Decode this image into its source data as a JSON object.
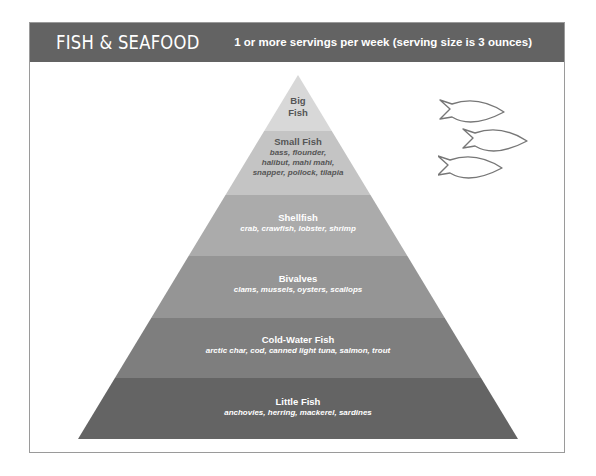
{
  "header": {
    "title": "FISH & SEAFOOD",
    "subtitle": "1 or more servings per week (serving size is 3 ounces)",
    "background_color": "#636363"
  },
  "pyramid": {
    "tiers": [
      {
        "name": "Big\nFish",
        "name_line1": "Big",
        "name_line2": "Fish",
        "items": "",
        "color": "#d8d8d8",
        "text_color": "#555555"
      },
      {
        "name": "Small Fish",
        "items_lines": [
          "bass, flounder,",
          "halibut, mahi mahi,",
          "snapper, pollock, tilapia"
        ],
        "items": "bass, flounder, halibut, mahi mahi, snapper, pollock, tilapia",
        "color": "#c4c4c4",
        "text_color": "#555555"
      },
      {
        "name": "Shellfish",
        "items": "crab, crawfish, lobster, shrimp",
        "color": "#ababab",
        "text_color": "#ffffff"
      },
      {
        "name": "Bivalves",
        "items": "clams, mussels, oysters, scallops",
        "color": "#959595",
        "text_color": "#ffffff"
      },
      {
        "name": "Cold-Water Fish",
        "items": "arctic char, cod, canned light tuna, salmon, trout",
        "color": "#7e7e7e",
        "text_color": "#ffffff"
      },
      {
        "name": "Little Fish",
        "items": "anchovies, herring, mackerel, sardines",
        "color": "#646464",
        "text_color": "#ffffff"
      }
    ]
  },
  "decoration": {
    "icon": "fish-school-icon",
    "count": 3
  }
}
